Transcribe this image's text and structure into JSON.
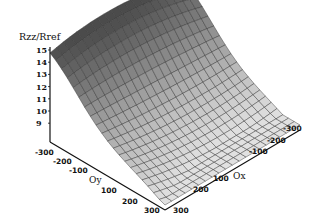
{
  "chart_data": {
    "type": "surface3d",
    "title": "",
    "zlabel": "Rzz/Rref",
    "xlabel": "Ox",
    "ylabel": "Oy",
    "x_ticks": [
      "-300",
      "-200",
      "-100",
      "100",
      "200",
      "300"
    ],
    "y_ticks": [
      "-300",
      "-200",
      "-100",
      "100",
      "200",
      "300"
    ],
    "z_ticks": [
      "15",
      "14",
      "13",
      "12",
      "11",
      "10",
      "9"
    ],
    "xlim": [
      -300,
      300
    ],
    "ylim": [
      -300,
      300
    ],
    "zlim": [
      9,
      15
    ],
    "grid_x": [
      -300,
      -270,
      -240,
      -210,
      -180,
      -150,
      -120,
      -90,
      -60,
      -30,
      0,
      30,
      60,
      90,
      120,
      150,
      180,
      210,
      240,
      270,
      300
    ],
    "grid_y": [
      -300,
      -270,
      -240,
      -210,
      -180,
      -150,
      -120,
      -90,
      -60,
      -30,
      0,
      30,
      60,
      90,
      120,
      150,
      180,
      210,
      240,
      270,
      300
    ],
    "corner_values": {
      "Ox-300_Oy-300": 12.3,
      "Ox300_Oy-300": 12.6,
      "Ox0_Oy-300": 15.0,
      "Ox-300_Oy300": 9.3,
      "Ox300_Oy300": 9.0,
      "Ox0_Oy0": 10.4
    },
    "shading": "grayscale, dark at high values, light at low values",
    "grid": true
  }
}
